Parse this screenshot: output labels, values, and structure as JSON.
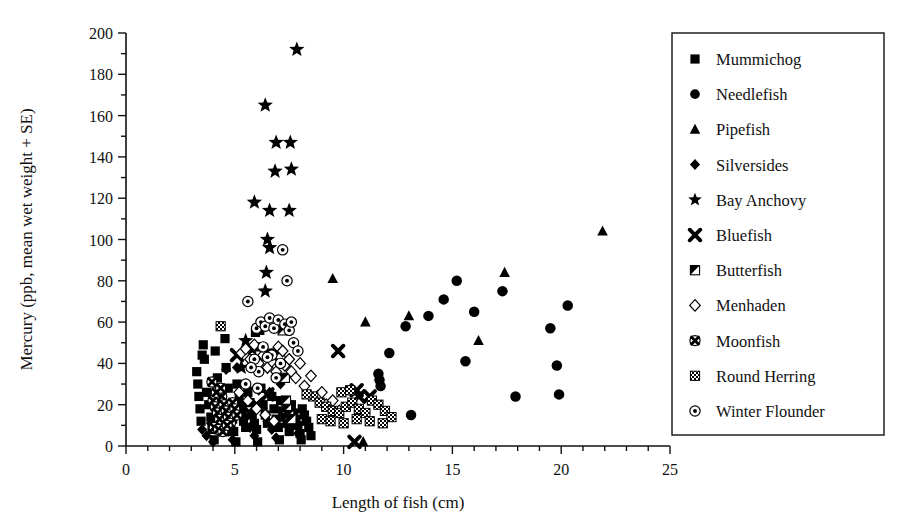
{
  "chart_data": {
    "type": "scatter",
    "title": "",
    "xlabel": "Length of fish (cm)",
    "ylabel": "Mercury (ppb, mean wet weight + SE)",
    "xlim": [
      0,
      25
    ],
    "ylim": [
      0,
      200
    ],
    "xticks": [
      0,
      5,
      10,
      15,
      20,
      25
    ],
    "xtick_labels": [
      "0",
      "5",
      "10",
      "15",
      "20",
      "25"
    ],
    "x_minor_tick_step": 1,
    "yticks": [
      0,
      20,
      40,
      60,
      80,
      100,
      120,
      140,
      160,
      180,
      200
    ],
    "ytick_labels": [
      "0",
      "20",
      "40",
      "60",
      "80",
      "100",
      "120",
      "140",
      "160",
      "180",
      "200"
    ],
    "y_minor_tick_step": 10,
    "grid": false,
    "legend_position": "right-outside",
    "marker_color": "#000000",
    "series": [
      {
        "name": "Mummichog",
        "marker": "filled-square",
        "points": [
          [
            3.25,
            36
          ],
          [
            3.3,
            30
          ],
          [
            3.35,
            24
          ],
          [
            3.4,
            18
          ],
          [
            3.45,
            12
          ],
          [
            3.6,
            42
          ],
          [
            3.7,
            26
          ],
          [
            3.8,
            20
          ],
          [
            3.9,
            14
          ],
          [
            3.95,
            8
          ],
          [
            4.1,
            46
          ],
          [
            4.2,
            33
          ],
          [
            4.3,
            22
          ],
          [
            4.35,
            16
          ],
          [
            4.45,
            10
          ],
          [
            4.6,
            38
          ],
          [
            4.7,
            28
          ],
          [
            4.8,
            19
          ],
          [
            4.9,
            13
          ],
          [
            4.95,
            7
          ],
          [
            5.1,
            30
          ],
          [
            5.2,
            24
          ],
          [
            5.3,
            17
          ],
          [
            5.4,
            12
          ],
          [
            5.5,
            9
          ],
          [
            5.6,
            26
          ],
          [
            5.7,
            21
          ],
          [
            5.8,
            15
          ],
          [
            5.9,
            11
          ],
          [
            6.0,
            8
          ],
          [
            6.1,
            48
          ],
          [
            6.2,
            28
          ],
          [
            6.3,
            20
          ],
          [
            6.4,
            15
          ],
          [
            6.5,
            11
          ],
          [
            6.6,
            45
          ],
          [
            6.7,
            24
          ],
          [
            6.8,
            18
          ],
          [
            6.9,
            13
          ],
          [
            7.0,
            9
          ],
          [
            7.1,
            22
          ],
          [
            7.2,
            17
          ],
          [
            7.3,
            14
          ],
          [
            7.4,
            11
          ],
          [
            7.5,
            7
          ],
          [
            7.6,
            20
          ],
          [
            7.7,
            16
          ],
          [
            7.8,
            13
          ],
          [
            7.9,
            10
          ],
          [
            8.0,
            6
          ],
          [
            8.1,
            18
          ],
          [
            8.2,
            15
          ],
          [
            8.3,
            12
          ],
          [
            8.4,
            9
          ],
          [
            8.5,
            5
          ],
          [
            5.05,
            2
          ],
          [
            6.05,
            2
          ],
          [
            7.05,
            3
          ],
          [
            8.05,
            3
          ],
          [
            4.05,
            3
          ],
          [
            5.95,
            55
          ],
          [
            6.15,
            56
          ],
          [
            4.55,
            52
          ],
          [
            3.55,
            49
          ],
          [
            3.5,
            44
          ]
        ]
      },
      {
        "name": "Needlefish",
        "marker": "filled-circle",
        "points": [
          [
            11.6,
            35
          ],
          [
            11.65,
            32
          ],
          [
            11.7,
            29
          ],
          [
            12.1,
            45
          ],
          [
            12.85,
            58
          ],
          [
            13.1,
            15
          ],
          [
            13.9,
            63
          ],
          [
            14.6,
            71
          ],
          [
            15.2,
            80
          ],
          [
            15.6,
            41
          ],
          [
            16.0,
            65
          ],
          [
            17.3,
            75
          ],
          [
            17.9,
            24
          ],
          [
            19.5,
            57
          ],
          [
            19.8,
            39
          ],
          [
            19.9,
            25
          ],
          [
            20.3,
            68
          ]
        ]
      },
      {
        "name": "Pipefish",
        "marker": "filled-triangle",
        "points": [
          [
            9.5,
            81
          ],
          [
            10.9,
            2
          ],
          [
            11.0,
            60
          ],
          [
            13.0,
            63
          ],
          [
            16.2,
            51
          ],
          [
            17.4,
            84
          ],
          [
            21.9,
            104
          ]
        ]
      },
      {
        "name": "Silversides",
        "marker": "filled-diamond",
        "points": [
          [
            3.5,
            8
          ],
          [
            3.7,
            5
          ],
          [
            3.9,
            11
          ],
          [
            4.0,
            2
          ],
          [
            4.1,
            23
          ],
          [
            4.3,
            17
          ],
          [
            4.5,
            12
          ],
          [
            4.7,
            7
          ],
          [
            4.9,
            3
          ],
          [
            5.1,
            38
          ],
          [
            5.3,
            20
          ],
          [
            5.5,
            14
          ],
          [
            5.7,
            9
          ],
          [
            5.9,
            5
          ],
          [
            6.1,
            27
          ],
          [
            6.3,
            18
          ],
          [
            6.5,
            12
          ],
          [
            6.7,
            8
          ],
          [
            6.9,
            4
          ],
          [
            7.1,
            30
          ],
          [
            7.3,
            21
          ],
          [
            7.5,
            15
          ],
          [
            7.7,
            10
          ],
          [
            7.9,
            6
          ],
          [
            4.6,
            37
          ],
          [
            5.6,
            28
          ],
          [
            6.6,
            26
          ]
        ]
      },
      {
        "name": "Bay Anchovy",
        "marker": "filled-star",
        "points": [
          [
            7.85,
            192
          ],
          [
            6.4,
            165
          ],
          [
            6.9,
            147
          ],
          [
            7.55,
            147
          ],
          [
            6.85,
            133
          ],
          [
            7.6,
            134
          ],
          [
            5.9,
            118
          ],
          [
            6.6,
            114
          ],
          [
            7.5,
            114
          ],
          [
            6.5,
            100
          ],
          [
            6.6,
            96
          ],
          [
            6.45,
            84
          ],
          [
            6.4,
            75
          ],
          [
            5.5,
            51
          ],
          [
            5.8,
            47
          ],
          [
            7.0,
            46
          ],
          [
            6.0,
            39
          ],
          [
            5.3,
            38
          ]
        ]
      },
      {
        "name": "Bluefish",
        "marker": "x-cross",
        "points": [
          [
            5.1,
            44
          ],
          [
            6.5,
            25
          ],
          [
            9.75,
            46
          ],
          [
            10.6,
            27
          ],
          [
            10.7,
            24
          ],
          [
            11.2,
            24
          ],
          [
            10.5,
            2
          ],
          [
            6.0,
            20
          ],
          [
            5.4,
            19
          ]
        ]
      },
      {
        "name": "Butterfish",
        "marker": "half-square",
        "points": [
          [
            7.2,
            56
          ],
          [
            7.3,
            33
          ],
          [
            7.35,
            22
          ],
          [
            7.4,
            18
          ],
          [
            7.5,
            15
          ],
          [
            7.6,
            13
          ]
        ]
      },
      {
        "name": "Menhaden",
        "marker": "open-diamond",
        "points": [
          [
            5.3,
            45
          ],
          [
            5.5,
            47
          ],
          [
            5.7,
            42
          ],
          [
            5.9,
            49
          ],
          [
            6.1,
            40
          ],
          [
            6.3,
            44
          ],
          [
            6.5,
            38
          ],
          [
            6.7,
            41
          ],
          [
            6.9,
            36
          ],
          [
            7.0,
            48
          ],
          [
            7.1,
            43
          ],
          [
            7.2,
            46
          ],
          [
            7.3,
            39
          ],
          [
            7.5,
            42
          ],
          [
            7.6,
            36
          ],
          [
            7.8,
            33
          ],
          [
            8.0,
            40
          ],
          [
            8.2,
            29
          ],
          [
            8.5,
            34
          ],
          [
            8.8,
            24
          ],
          [
            9.0,
            26
          ],
          [
            9.2,
            20
          ],
          [
            9.5,
            22
          ],
          [
            9.8,
            17
          ],
          [
            5.2,
            26
          ],
          [
            5.6,
            22
          ],
          [
            6.0,
            18
          ],
          [
            6.4,
            15
          ],
          [
            6.8,
            12
          ]
        ]
      },
      {
        "name": "Moonfish",
        "marker": "circled-cross",
        "points": [
          [
            4.0,
            22
          ],
          [
            4.1,
            19
          ],
          [
            4.2,
            16
          ],
          [
            4.3,
            13
          ],
          [
            4.4,
            24
          ],
          [
            4.5,
            20
          ],
          [
            4.6,
            17
          ],
          [
            4.7,
            14
          ],
          [
            4.8,
            11
          ],
          [
            4.9,
            21
          ],
          [
            5.0,
            18
          ],
          [
            5.1,
            15
          ],
          [
            4.05,
            9
          ],
          [
            4.25,
            8
          ],
          [
            4.45,
            7
          ],
          [
            4.65,
            10
          ],
          [
            4.15,
            26
          ],
          [
            4.35,
            28
          ],
          [
            3.95,
            31
          ]
        ]
      },
      {
        "name": "Round Herring",
        "marker": "checkered-square",
        "points": [
          [
            4.35,
            58
          ],
          [
            8.6,
            24
          ],
          [
            8.9,
            21
          ],
          [
            9.2,
            19
          ],
          [
            9.5,
            17
          ],
          [
            9.8,
            16
          ],
          [
            10.1,
            19
          ],
          [
            10.4,
            21
          ],
          [
            10.7,
            18
          ],
          [
            11.0,
            16
          ],
          [
            11.3,
            22
          ],
          [
            11.6,
            20
          ],
          [
            11.9,
            17
          ],
          [
            12.2,
            14
          ],
          [
            9.0,
            13
          ],
          [
            9.4,
            12
          ],
          [
            10.0,
            11
          ],
          [
            10.6,
            13
          ],
          [
            11.2,
            12
          ],
          [
            11.8,
            11
          ],
          [
            9.9,
            26
          ],
          [
            10.3,
            27
          ],
          [
            8.3,
            25
          ]
        ]
      },
      {
        "name": "Winter Flounder",
        "marker": "circled-dot",
        "points": [
          [
            5.6,
            70
          ],
          [
            6.0,
            57
          ],
          [
            6.2,
            60
          ],
          [
            6.4,
            58
          ],
          [
            6.6,
            62
          ],
          [
            6.8,
            57
          ],
          [
            7.0,
            61
          ],
          [
            7.2,
            95
          ],
          [
            7.3,
            59
          ],
          [
            7.5,
            56
          ],
          [
            7.6,
            60
          ],
          [
            7.7,
            50
          ],
          [
            7.9,
            46
          ],
          [
            6.9,
            33
          ],
          [
            7.1,
            40
          ],
          [
            6.7,
            44
          ],
          [
            6.3,
            48
          ],
          [
            5.9,
            42
          ],
          [
            5.5,
            30
          ],
          [
            6.1,
            36
          ],
          [
            7.4,
            80
          ],
          [
            6.5,
            43
          ],
          [
            6.05,
            28
          ],
          [
            5.75,
            38
          ]
        ]
      }
    ]
  },
  "legend": {
    "items": [
      {
        "label": "Mummichog",
        "marker": "filled-square"
      },
      {
        "label": "Needlefish",
        "marker": "filled-circle"
      },
      {
        "label": "Pipefish",
        "marker": "filled-triangle"
      },
      {
        "label": "Silversides",
        "marker": "filled-diamond"
      },
      {
        "label": "Bay Anchovy",
        "marker": "filled-star"
      },
      {
        "label": "Bluefish",
        "marker": "x-cross"
      },
      {
        "label": "Butterfish",
        "marker": "half-square"
      },
      {
        "label": "Menhaden",
        "marker": "open-diamond"
      },
      {
        "label": "Moonfish",
        "marker": "circled-cross"
      },
      {
        "label": "Round Herring",
        "marker": "checkered-square"
      },
      {
        "label": "Winter Flounder",
        "marker": "circled-dot"
      }
    ]
  }
}
